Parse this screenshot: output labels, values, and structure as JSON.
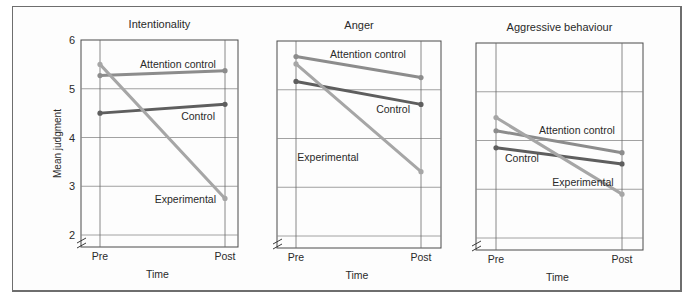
{
  "chart_data": [
    {
      "type": "line",
      "title": "Intentionality",
      "xlabel": "Time",
      "ylabel": "Mean judgment",
      "categories": [
        "Pre",
        "Post"
      ],
      "ylim": [
        2,
        6
      ],
      "yticks": [
        "2",
        "3",
        "4",
        "5",
        "6"
      ],
      "show_yticks": true,
      "grid": true,
      "series": [
        {
          "name": "Attention control",
          "values": [
            5.27,
            5.37
          ],
          "color": "#8c8c8c"
        },
        {
          "name": "Control",
          "values": [
            4.5,
            4.68
          ],
          "color": "#5e5e5e"
        },
        {
          "name": "Experimental",
          "values": [
            5.5,
            2.75
          ],
          "color": "#a6a6a6"
        }
      ]
    },
    {
      "type": "line",
      "title": "Anger",
      "xlabel": "Time",
      "ylabel": "",
      "categories": [
        "Pre",
        "Post"
      ],
      "ylim": [
        2,
        6
      ],
      "yticks": [],
      "show_yticks": false,
      "grid": true,
      "series": [
        {
          "name": "Attention control",
          "values": [
            5.68,
            5.25
          ],
          "color": "#8c8c8c"
        },
        {
          "name": "Control",
          "values": [
            5.17,
            4.7
          ],
          "color": "#5e5e5e"
        },
        {
          "name": "Experimental",
          "values": [
            5.53,
            3.32
          ],
          "color": "#a6a6a6"
        }
      ]
    },
    {
      "type": "line",
      "title": "Aggressive behaviour",
      "xlabel": "Time",
      "ylabel": "",
      "categories": [
        "Pre",
        "Post"
      ],
      "ylim": [
        2,
        6
      ],
      "yticks": [],
      "show_yticks": false,
      "grid": true,
      "series": [
        {
          "name": "Attention control",
          "values": [
            4.2,
            3.75
          ],
          "color": "#8c8c8c"
        },
        {
          "name": "Control",
          "values": [
            3.85,
            3.52
          ],
          "color": "#5e5e5e"
        },
        {
          "name": "Experimental",
          "values": [
            4.47,
            2.9
          ],
          "color": "#a6a6a6"
        }
      ]
    }
  ]
}
